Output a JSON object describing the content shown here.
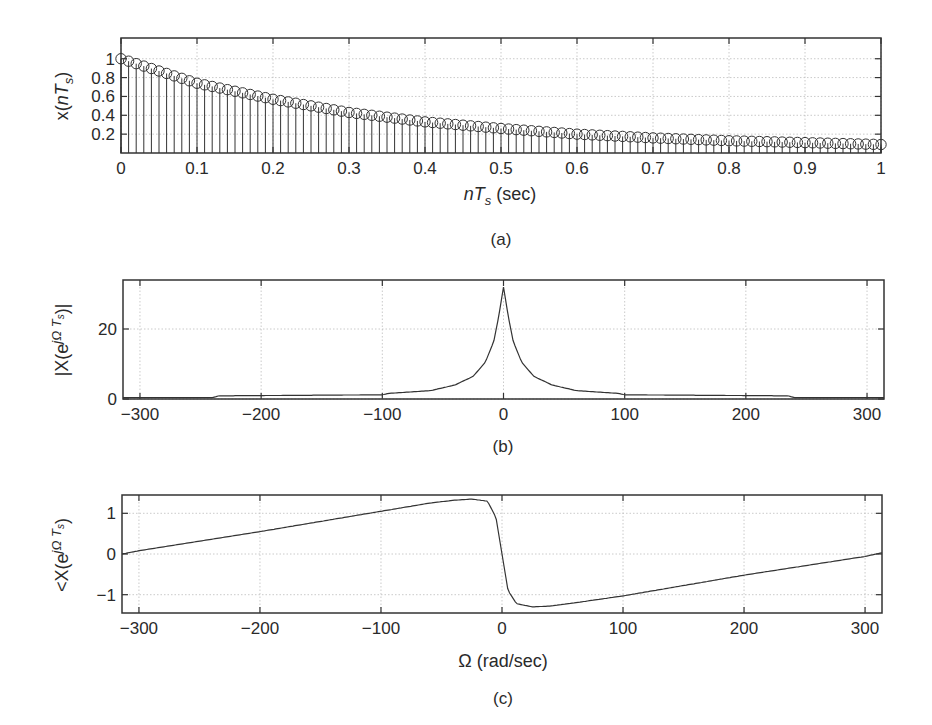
{
  "chart_data": [
    {
      "id": "a",
      "type": "stem",
      "caption": "(a)",
      "title": "",
      "xlabel": "nT_s (sec)",
      "ylabel": "x(nT_s)",
      "xlim": [
        0,
        1
      ],
      "ylim": [
        0,
        1.22
      ],
      "xticks": [
        0,
        0.1,
        0.2,
        0.3,
        0.4,
        0.5,
        0.6,
        0.7,
        0.8,
        0.9,
        1
      ],
      "xtick_labels": [
        "0",
        "0.1",
        "0.2",
        "0.3",
        "0.4",
        "0.5",
        "0.6",
        "0.7",
        "0.8",
        "0.9",
        "1"
      ],
      "yticks": [
        0.2,
        0.4,
        0.6,
        0.8,
        1
      ],
      "ytick_labels": [
        "0.2",
        "0.4",
        "0.6",
        "0.8",
        "1"
      ],
      "grid": true,
      "marker": "circle",
      "sample_spacing": 0.01,
      "x": [
        0,
        0.1,
        0.2,
        0.3,
        0.4,
        0.5,
        0.6,
        0.7,
        0.8,
        0.9,
        1.0
      ],
      "values": [
        1.0,
        0.74,
        0.57,
        0.43,
        0.33,
        0.26,
        0.2,
        0.16,
        0.13,
        0.11,
        0.09
      ]
    },
    {
      "id": "b",
      "type": "line",
      "caption": "(b)",
      "xlabel": "",
      "ylabel": "|X(e^{jΩT_s})|",
      "xlim": [
        -314,
        314
      ],
      "ylim": [
        0,
        34
      ],
      "xticks": [
        -300,
        -200,
        -100,
        0,
        100,
        200,
        300
      ],
      "xtick_labels": [
        "−300",
        "−200",
        "−100",
        "0",
        "100",
        "200",
        "300"
      ],
      "yticks": [
        0,
        20
      ],
      "ytick_labels": [
        "0",
        "20"
      ],
      "grid": true,
      "x": [
        -314,
        -240,
        -235,
        -100,
        -95,
        -60,
        -40,
        -25,
        -15,
        -8,
        -4,
        0,
        4,
        8,
        15,
        25,
        40,
        60,
        95,
        100,
        235,
        240,
        314
      ],
      "values": [
        0.4,
        0.4,
        0.9,
        1.2,
        1.6,
        2.4,
        4.0,
        6.5,
        10.5,
        16.5,
        23.5,
        32,
        23.5,
        16.5,
        10.5,
        6.5,
        4.0,
        2.4,
        1.6,
        1.2,
        0.9,
        0.4,
        0.4
      ]
    },
    {
      "id": "c",
      "type": "line",
      "caption": "(c)",
      "xlabel": "Ω (rad/sec)",
      "ylabel": "<X(e^{jΩT_s})",
      "xlim": [
        -314,
        314
      ],
      "ylim": [
        -1.45,
        1.45
      ],
      "xticks": [
        -300,
        -200,
        -100,
        0,
        100,
        200,
        300
      ],
      "xtick_labels": [
        "−300",
        "−200",
        "−100",
        "0",
        "100",
        "200",
        "300"
      ],
      "yticks": [
        -1,
        0,
        1
      ],
      "ytick_labels": [
        "−1",
        "0",
        "1"
      ],
      "grid": true,
      "x": [
        -314,
        -300,
        -200,
        -100,
        -60,
        -40,
        -25,
        -12,
        -5,
        0,
        5,
        12,
        25,
        40,
        60,
        100,
        200,
        300,
        314
      ],
      "values": [
        0.0,
        0.08,
        0.55,
        1.05,
        1.25,
        1.32,
        1.35,
        1.3,
        0.9,
        0.0,
        -0.9,
        -1.22,
        -1.3,
        -1.28,
        -1.2,
        -1.03,
        -0.52,
        -0.06,
        0.03
      ]
    }
  ],
  "labels": {
    "a_xlabel_main": "nT",
    "a_xlabel_sub": "s",
    "a_xlabel_unit": " (sec)",
    "a_ylabel_pre": "x(",
    "a_ylabel_main": "nT",
    "a_ylabel_sub": "s",
    "a_ylabel_post": ")",
    "b_ylabel": "|X(e",
    "b_ylabel_sup": "jΩ T",
    "b_ylabel_supsub": "s",
    "b_ylabel_post": ")|",
    "c_ylabel": "<X(e",
    "c_ylabel_sup": "jΩ T",
    "c_ylabel_supsub": "s",
    "c_ylabel_post": ")",
    "c_xlabel": "Ω (rad/sec)",
    "cap_a": "(a)",
    "cap_b": "(b)",
    "cap_c": "(c)"
  },
  "style": {
    "line_color": "#333333",
    "grid_color": "#bdbdbd",
    "axis_color": "#333333"
  }
}
